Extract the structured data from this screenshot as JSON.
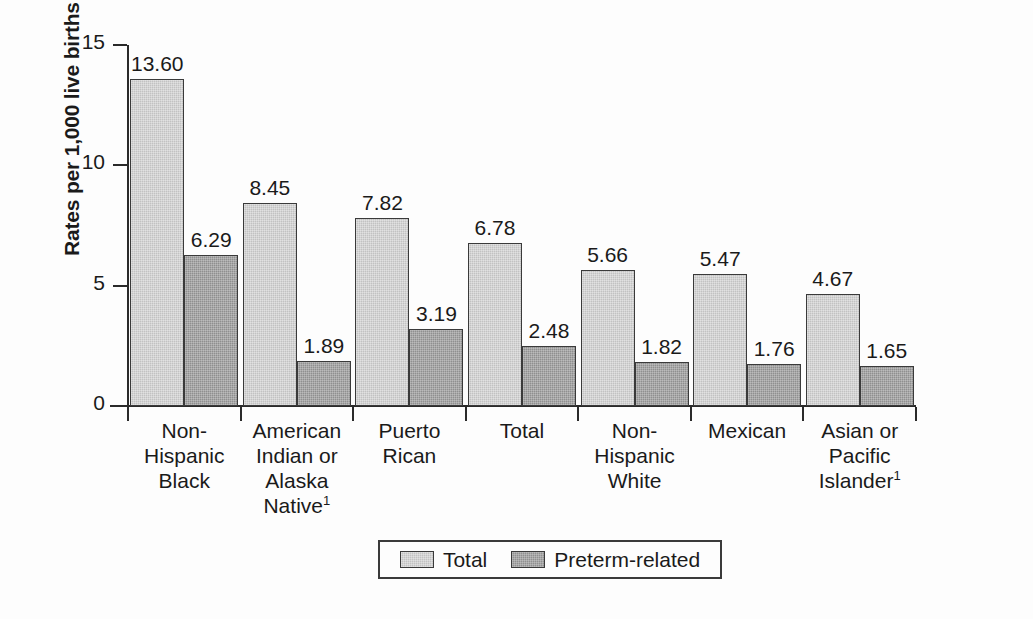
{
  "chart_data": {
    "type": "bar",
    "title": "",
    "xlabel": "",
    "ylabel": "Rates per 1,000 live births",
    "ylim": [
      0,
      15
    ],
    "yticks": [
      "0",
      "5",
      "10",
      "15"
    ],
    "grid": false,
    "legend_position": "bottom-center",
    "categories": [
      "Non-\nHispanic\nBlack",
      "American\nIndian or\nAlaska\nNative",
      "Puerto\nRican",
      "Total",
      "Non-\nHispanic\nWhite",
      "Mexican",
      "Asian or\nPacific\nIslander"
    ],
    "category_footnotes": [
      "",
      "1",
      "",
      "",
      "",
      "",
      "1"
    ],
    "series": [
      {
        "name": "Total",
        "color": "#c2c2c2",
        "values": [
          13.6,
          8.45,
          7.82,
          6.78,
          5.66,
          5.47,
          4.67
        ],
        "labels": [
          "13.60",
          "8.45",
          "7.82",
          "6.78",
          "5.66",
          "5.47",
          "4.67"
        ]
      },
      {
        "name": "Preterm-related",
        "color": "#8f8f8f",
        "values": [
          6.29,
          1.89,
          3.19,
          2.48,
          1.82,
          1.76,
          1.65
        ],
        "labels": [
          "6.29",
          "1.89",
          "3.19",
          "2.48",
          "1.82",
          "1.76",
          "1.65"
        ]
      }
    ]
  },
  "legend": {
    "items": [
      {
        "label": "Total",
        "swatch": "total"
      },
      {
        "label": "Preterm-related",
        "swatch": "preterm"
      }
    ]
  }
}
